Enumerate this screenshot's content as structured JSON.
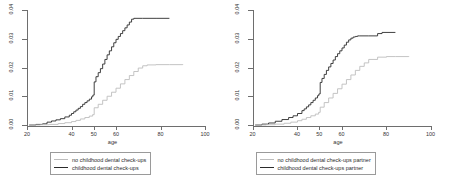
{
  "figure": {
    "background": "#ffffff",
    "panels": [
      {
        "id": "left",
        "axis": {
          "xlabel": "age",
          "xticks": [
            "20",
            "40",
            "50",
            "60",
            "80",
            "100"
          ],
          "xtick_values": [
            20,
            40,
            50,
            60,
            80,
            100
          ],
          "xlim": [
            20,
            100
          ],
          "yticks": [
            "0.00",
            "0.01",
            "0.02",
            "0.03",
            "0.04"
          ],
          "ytick_values": [
            0.0,
            0.01,
            0.02,
            0.03,
            0.04
          ],
          "ylim": [
            0.0,
            0.04
          ]
        },
        "legend": [
          {
            "label": "no childhood dental check-ups",
            "color": "#bdbdbd"
          },
          {
            "label": "childhood dental check-ups",
            "color": "#2b2b2b"
          }
        ]
      },
      {
        "id": "right",
        "axis": {
          "xlabel": "age",
          "xticks": [
            "20",
            "40",
            "50",
            "60",
            "80",
            "100"
          ],
          "xtick_values": [
            20,
            40,
            50,
            60,
            80,
            100
          ],
          "xlim": [
            20,
            100
          ],
          "yticks": [
            "0.00",
            "0.01",
            "0.02",
            "0.03",
            "0.04"
          ],
          "ytick_values": [
            0.0,
            0.01,
            0.02,
            0.03,
            0.04
          ],
          "ylim": [
            0.0,
            0.04
          ]
        },
        "legend": [
          {
            "label": "no childhood dental check-ups partner",
            "color": "#bdbdbd"
          },
          {
            "label": "childhood dental check-ups partner",
            "color": "#2b2b2b"
          }
        ]
      }
    ]
  },
  "chart_data": [
    {
      "type": "line",
      "subtype": "step-cumulative-incidence",
      "title": "",
      "xlabel": "age",
      "ylabel": "",
      "xlim": [
        20,
        100
      ],
      "ylim": [
        0.0,
        0.04
      ],
      "xticks": [
        20,
        40,
        50,
        60,
        80,
        100
      ],
      "yticks": [
        0.0,
        0.01,
        0.02,
        0.03,
        0.04
      ],
      "grid": false,
      "legend_position": "below",
      "series": [
        {
          "name": "childhood dental check-ups",
          "color": "#2b2b2b",
          "x": [
            21,
            24,
            27,
            29,
            31,
            33,
            35,
            37,
            39,
            40,
            41,
            42,
            43,
            44,
            45,
            46,
            47,
            48,
            49,
            49.6,
            50.2,
            51,
            52,
            53,
            54,
            55,
            56,
            57,
            58,
            59,
            60,
            61,
            62,
            63,
            64,
            65,
            66,
            67,
            68,
            72,
            78,
            84
          ],
          "y": [
            0.0,
            0.0002,
            0.0004,
            0.001,
            0.0014,
            0.0018,
            0.0022,
            0.0028,
            0.0034,
            0.004,
            0.0046,
            0.0052,
            0.0058,
            0.0064,
            0.0072,
            0.0078,
            0.0084,
            0.009,
            0.0098,
            0.0104,
            0.015,
            0.0168,
            0.0182,
            0.0196,
            0.0212,
            0.0228,
            0.0244,
            0.0258,
            0.0272,
            0.0286,
            0.0298,
            0.0308,
            0.0318,
            0.0328,
            0.0338,
            0.0348,
            0.0358,
            0.0368,
            0.0371,
            0.0371,
            0.0371,
            0.0371
          ]
        },
        {
          "name": "no childhood dental check-ups",
          "color": "#bdbdbd",
          "x": [
            21,
            26,
            30,
            34,
            37,
            40,
            42,
            44,
            46,
            48,
            49.5,
            50.2,
            52,
            54,
            56,
            58,
            60,
            62,
            64,
            66,
            68,
            70,
            72,
            74,
            78,
            84,
            90
          ],
          "y": [
            0.0,
            0.0001,
            0.0002,
            0.0005,
            0.0008,
            0.0012,
            0.0016,
            0.0021,
            0.0026,
            0.0031,
            0.0036,
            0.006,
            0.0072,
            0.0086,
            0.01,
            0.0114,
            0.0128,
            0.0143,
            0.0158,
            0.0172,
            0.0186,
            0.0198,
            0.0206,
            0.0209,
            0.021,
            0.021,
            0.0212
          ]
        }
      ]
    },
    {
      "type": "line",
      "subtype": "step-cumulative-incidence",
      "title": "",
      "xlabel": "age",
      "ylabel": "",
      "xlim": [
        20,
        100
      ],
      "ylim": [
        0.0,
        0.04
      ],
      "xticks": [
        20,
        40,
        50,
        60,
        80,
        100
      ],
      "yticks": [
        0.0,
        0.01,
        0.02,
        0.03,
        0.04
      ],
      "grid": false,
      "legend_position": "below",
      "series": [
        {
          "name": "childhood dental check-ups partner",
          "color": "#2b2b2b",
          "x": [
            21,
            24,
            27,
            30,
            33,
            36,
            38,
            40,
            42,
            43,
            44,
            45,
            46,
            47,
            48,
            49,
            49.6,
            50.2,
            51,
            52,
            53,
            54,
            55,
            56,
            57,
            58,
            59,
            60,
            61,
            62,
            63,
            64,
            65,
            66,
            67,
            68,
            72,
            76,
            78,
            84
          ],
          "y": [
            0.0,
            0.0003,
            0.0007,
            0.0013,
            0.0019,
            0.0026,
            0.0032,
            0.004,
            0.005,
            0.0056,
            0.0063,
            0.007,
            0.0078,
            0.0086,
            0.0094,
            0.0102,
            0.0108,
            0.0148,
            0.0162,
            0.0176,
            0.019,
            0.0202,
            0.0214,
            0.0226,
            0.0238,
            0.0248,
            0.0258,
            0.0268,
            0.0278,
            0.0288,
            0.0296,
            0.0302,
            0.0306,
            0.0308,
            0.031,
            0.031,
            0.031,
            0.0318,
            0.0322,
            0.0322
          ]
        },
        {
          "name": "no childhood dental check-ups partner",
          "color": "#bdbdbd",
          "x": [
            21,
            26,
            30,
            34,
            37,
            40,
            42,
            44,
            46,
            48,
            49.5,
            50.2,
            52,
            54,
            56,
            58,
            60,
            62,
            64,
            66,
            68,
            70,
            72,
            76,
            80,
            84,
            90
          ],
          "y": [
            0.0,
            0.0001,
            0.0003,
            0.0006,
            0.001,
            0.0015,
            0.002,
            0.0026,
            0.0032,
            0.0038,
            0.0044,
            0.0062,
            0.0078,
            0.0094,
            0.011,
            0.0126,
            0.0142,
            0.0158,
            0.0174,
            0.019,
            0.0204,
            0.0216,
            0.0228,
            0.0236,
            0.0238,
            0.0238,
            0.024
          ]
        }
      ]
    }
  ]
}
